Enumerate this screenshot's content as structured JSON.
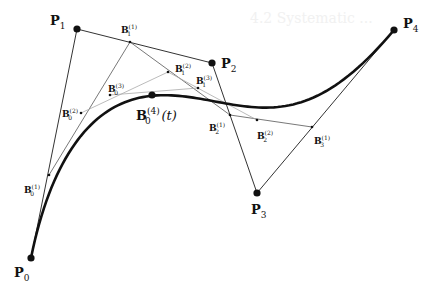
{
  "figure": {
    "type": "de Casteljau construction of a quartic Bezier curve",
    "background_text": "4.2 Systematic ...",
    "colors": {
      "curve": "#111111",
      "control_polygon": "#333333",
      "level2": "#555555",
      "level3": "#aaaaaa",
      "points": "#111111"
    },
    "control_points": [
      {
        "id": "P0",
        "name": "P",
        "sub": "0",
        "x": 31,
        "y": 258,
        "label_x": 14,
        "label_y": 277
      },
      {
        "id": "P1",
        "name": "P",
        "sub": "1",
        "x": 77,
        "y": 29,
        "label_x": 50,
        "label_y": 25
      },
      {
        "id": "P2",
        "name": "P",
        "sub": "2",
        "x": 212,
        "y": 63,
        "label_x": 221,
        "label_y": 68
      },
      {
        "id": "P3",
        "name": "P",
        "sub": "3",
        "x": 257,
        "y": 193,
        "label_x": 251,
        "label_y": 214
      },
      {
        "id": "P4",
        "name": "P",
        "sub": "4",
        "x": 394,
        "y": 30,
        "label_x": 403,
        "label_y": 28
      }
    ],
    "intermediate_points": [
      {
        "id": "B0_1",
        "name": "B",
        "sub": "0",
        "sup": "(1)",
        "x": 49,
        "y": 175,
        "label_x": 24,
        "label_y": 193
      },
      {
        "id": "B1_1",
        "name": "B",
        "sub": "1",
        "sup": "(1)",
        "x": 130,
        "y": 42,
        "label_x": 121,
        "label_y": 33
      },
      {
        "id": "B2_1",
        "name": "B",
        "sub": "2",
        "sup": "(1)",
        "x": 230,
        "y": 115,
        "label_x": 209,
        "label_y": 131
      },
      {
        "id": "B3_1",
        "name": "B",
        "sub": "3",
        "sup": "(1)",
        "x": 312,
        "y": 127,
        "label_x": 314,
        "label_y": 144
      },
      {
        "id": "B0_2",
        "name": "B",
        "sub": "0",
        "sup": "(2)",
        "x": 81,
        "y": 113,
        "label_x": 62,
        "label_y": 117
      },
      {
        "id": "B1_2",
        "name": "B",
        "sub": "1",
        "sup": "(2)",
        "x": 168,
        "y": 72,
        "label_x": 175,
        "label_y": 72
      },
      {
        "id": "B2_2",
        "name": "B",
        "sub": "2",
        "sup": "(2)",
        "x": 257,
        "y": 120,
        "label_x": 257,
        "label_y": 139
      },
      {
        "id": "B0_3",
        "name": "B",
        "sub": "0",
        "sup": "(3)",
        "x": 110,
        "y": 95,
        "label_x": 108,
        "label_y": 92
      },
      {
        "id": "B1_3",
        "name": "B",
        "sub": "1",
        "sup": "(3)",
        "x": 198,
        "y": 88,
        "label_x": 196,
        "label_y": 84
      }
    ],
    "curve_point": {
      "id": "B0_4",
      "name": "B",
      "sub": "0",
      "sup": "(4)",
      "suffix": "(t)",
      "x": 152,
      "y": 95,
      "label_x": 136,
      "label_y": 120
    }
  }
}
